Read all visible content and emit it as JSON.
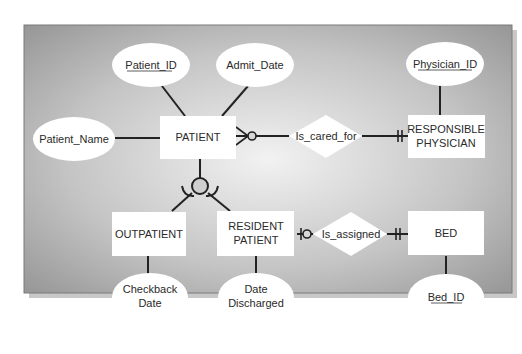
{
  "diagram": {
    "background": {
      "center_color": "#f2f2f2",
      "edge_color": "#8f8f8f",
      "shadow_color": "#c8c8c8"
    },
    "entities": {
      "patient": "PATIENT",
      "responsible_physician": [
        "RESPONSIBLE",
        "PHYSICIAN"
      ],
      "outpatient": "OUTPATIENT",
      "resident_patient": [
        "RESIDENT",
        "PATIENT"
      ],
      "bed": "BED"
    },
    "attributes": {
      "patient_id": {
        "label": "Patient_ID",
        "identifier": true
      },
      "admit_date": {
        "label": "Admit_Date",
        "identifier": false
      },
      "patient_name": {
        "label": "Patient_Name",
        "identifier": false
      },
      "physician_id": {
        "label": "Physician_ID",
        "identifier": true
      },
      "checkback_date": {
        "label": [
          "Checkback",
          "Date"
        ],
        "identifier": false
      },
      "date_discharged": {
        "label": [
          "Date",
          "Discharged"
        ],
        "identifier": false
      },
      "bed_id": {
        "label": "Bed_ID",
        "identifier": true
      }
    },
    "relationships": {
      "is_cared_for": {
        "label": "Is_cared_for",
        "from": "PATIENT",
        "from_cardinality": "zero-or-many",
        "to": "RESPONSIBLE PHYSICIAN",
        "to_cardinality": "one-and-only-one"
      },
      "is_assigned": {
        "label": "Is_assigned",
        "from": "RESIDENT PATIENT",
        "from_cardinality": "zero-or-one",
        "to": "BED",
        "to_cardinality": "one-and-only-one"
      }
    },
    "subtype": {
      "supertype": "PATIENT",
      "subtypes": [
        "OUTPATIENT",
        "RESIDENT PATIENT"
      ]
    }
  }
}
